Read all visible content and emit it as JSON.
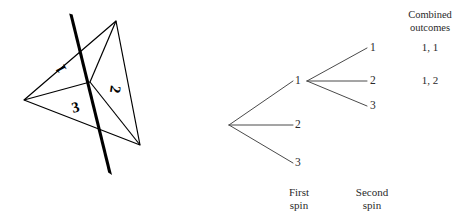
{
  "figure": {
    "type": "probability-tree-with-spinner",
    "spinner": {
      "name": "triangular-spinner",
      "sector_labels": [
        "1",
        "2",
        "3"
      ],
      "needle_color": "#000000",
      "outline_color": "#000000"
    },
    "tree": {
      "first_spin_branches": [
        "1",
        "2",
        "3"
      ],
      "second_spin_branches": [
        "1",
        "2",
        "3"
      ],
      "line_color": "#444444"
    },
    "captions": {
      "first_spin_line1": "First",
      "first_spin_line2": "spin",
      "second_spin_line1": "Second",
      "second_spin_line2": "spin"
    },
    "outcomes": {
      "header_line1": "Combined",
      "header_line2": "outcomes",
      "rows": [
        "1, 1",
        "1, 2"
      ]
    }
  }
}
